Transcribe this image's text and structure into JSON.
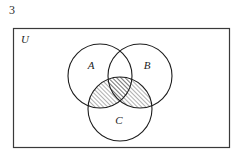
{
  "figure": {
    "number": "3",
    "kind": "venn-diagram"
  },
  "diagram": {
    "universe_label": "U",
    "universe_rect": {
      "x": 13,
      "y": 28,
      "width": 217,
      "height": 120
    },
    "circles": [
      {
        "name": "A",
        "label": "A",
        "cx": 100,
        "cy": 76,
        "r": 32,
        "label_x": 91,
        "label_y": 69
      },
      {
        "name": "B",
        "label": "B",
        "cx": 140,
        "cy": 76,
        "r": 32,
        "label_x": 143,
        "label_y": 69
      },
      {
        "name": "C",
        "label": "C",
        "cx": 120,
        "cy": 109,
        "r": 32,
        "label_x": 117,
        "label_y": 123
      }
    ],
    "shaded_region": {
      "description": "C intersect (A union B)",
      "fill": "hatch-45",
      "hatch_color": "#1c1c1c",
      "hatch_spacing_px": 3
    },
    "stroke_color": "#1c1c1c",
    "rect_stroke_color": "#3a3a3a",
    "background": "#ffffff"
  }
}
